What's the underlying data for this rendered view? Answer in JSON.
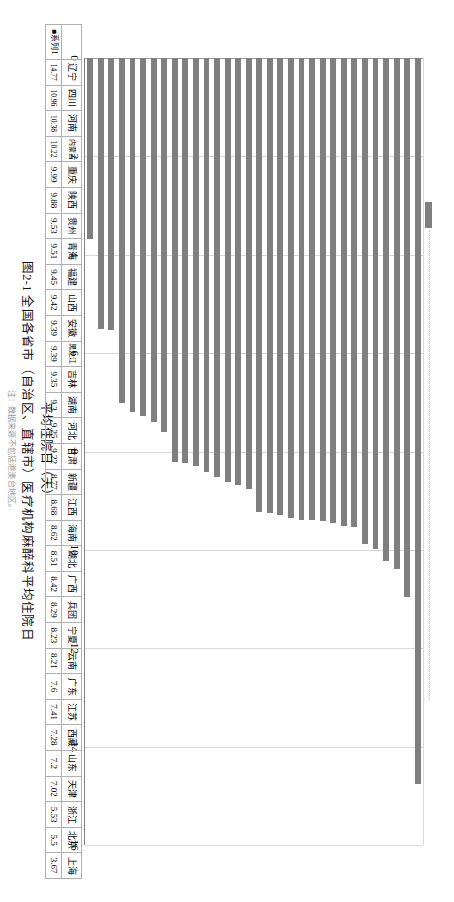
{
  "figure": {
    "caption": "图2-1  全国各省市（自治区、直辖市）医疗机构麻醉科平均住院日",
    "note": "注：数据来源不包括港澳台地区。"
  },
  "legend": {
    "series_label": "系列1",
    "swatch_color": "#7f7f7f"
  },
  "axis": {
    "value_title": "平均住院日（天）",
    "ticks": [
      "0",
      "2",
      "4",
      "6",
      "8",
      "10",
      "12",
      "14",
      "16"
    ],
    "min": 0,
    "max": 16
  },
  "table": {
    "row_header": "■系列1",
    "categories": [
      "辽宁",
      "四川",
      "河南",
      "内蒙古",
      "重庆",
      "陕西",
      "贵州",
      "青海",
      "福建",
      "山西",
      "安徽",
      "黑龙江",
      "吉林",
      "湖南",
      "河北",
      "甘肃",
      "新疆",
      "江西",
      "海南",
      "湖北",
      "广西",
      "兵团",
      "宁夏",
      "云南",
      "广东",
      "江苏",
      "西藏",
      "山东",
      "天津",
      "浙江",
      "北京",
      "上海"
    ],
    "values": [
      "14.77",
      "10.96",
      "10.38",
      "10.22",
      "9.99",
      "9.88",
      "9.53",
      "9.51",
      "9.45",
      "9.42",
      "9.39",
      "9.39",
      "9.35",
      "9.3",
      "9.25",
      "9.22",
      "8.77",
      "8.68",
      "8.62",
      "8.51",
      "8.42",
      "8.29",
      "8.23",
      "8.21",
      "7.6",
      "7.41",
      "7.28",
      "7.2",
      "7.02",
      "5.53",
      "5.5",
      "3.67"
    ]
  },
  "chart_data": {
    "type": "bar",
    "title": "图2-1  全国各省市（自治区、直辖市）医疗机构麻醉科平均住院日",
    "orientation": "horizontal",
    "xlabel": "平均住院日（天）",
    "ylabel": "",
    "xlim": [
      0,
      16
    ],
    "grid": true,
    "legend_position": "top",
    "series": [
      {
        "name": "系列1",
        "color": "#7f7f7f",
        "values": [
          14.77,
          10.96,
          10.38,
          10.22,
          9.99,
          9.88,
          9.53,
          9.51,
          9.45,
          9.42,
          9.39,
          9.39,
          9.35,
          9.3,
          9.25,
          9.22,
          8.77,
          8.68,
          8.62,
          8.51,
          8.42,
          8.29,
          8.23,
          8.21,
          7.6,
          7.41,
          7.28,
          7.2,
          7.02,
          5.53,
          5.5,
          3.67
        ]
      }
    ],
    "categories": [
      "辽宁",
      "四川",
      "河南",
      "内蒙古",
      "重庆",
      "陕西",
      "贵州",
      "青海",
      "福建",
      "山西",
      "安徽",
      "黑龙江",
      "吉林",
      "湖南",
      "河北",
      "甘肃",
      "新疆",
      "江西",
      "海南",
      "湖北",
      "广西",
      "兵团",
      "宁夏",
      "云南",
      "广东",
      "江苏",
      "西藏",
      "山东",
      "天津",
      "浙江",
      "北京",
      "上海"
    ],
    "tick_values": [
      0,
      2,
      4,
      6,
      8,
      10,
      12,
      14,
      16
    ]
  }
}
